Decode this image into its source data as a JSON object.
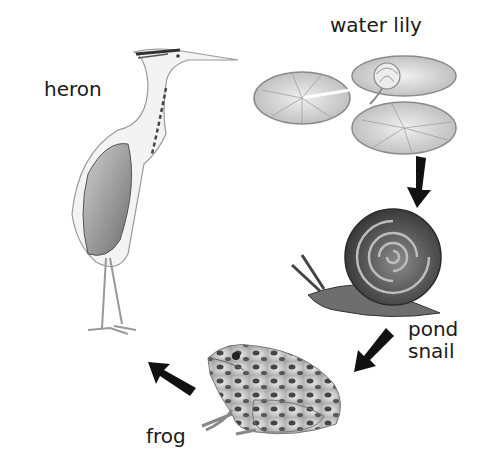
{
  "diagram": {
    "type": "food-chain",
    "organisms": [
      {
        "id": "water-lily",
        "label": "water lily"
      },
      {
        "id": "pond-snail",
        "label": "pond\nsnail"
      },
      {
        "id": "frog",
        "label": "frog"
      },
      {
        "id": "heron",
        "label": "heron"
      }
    ],
    "arrows": [
      {
        "from": "water lily",
        "to": "pond snail"
      },
      {
        "from": "pond snail",
        "to": "frog"
      },
      {
        "from": "frog",
        "to": "heron"
      }
    ],
    "colors": {
      "arrow": "#111111",
      "text": "#1a1a1a",
      "background": "#ffffff"
    }
  }
}
